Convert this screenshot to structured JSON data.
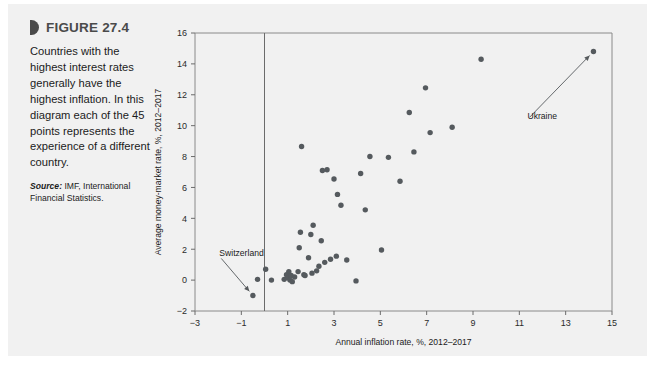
{
  "figure": {
    "marker_icon": "triangle-marker-icon",
    "label": "FIGURE 27.4",
    "caption": "Countries with the highest interest rates generally have the highest inflation. In this diagram each of the 45 points represents the experience of a different country.",
    "source_label": "Source:",
    "source_text": " IMF, International Financial Statistics."
  },
  "colors": {
    "card_background": "#f1f1f1",
    "point": "#555a5e",
    "axis": "#6b6b6b",
    "frame": "#8a8a8a",
    "title_text": "#4a4a4a",
    "body_text": "#1b1b1b"
  },
  "chart_data": {
    "type": "scatter",
    "title": "",
    "xlabel": "Annual inflation rate, %, 2012–2017",
    "ylabel": "Average money-market rate, %, 2012–2017",
    "xlim": [
      -3,
      15
    ],
    "ylim": [
      -2,
      16
    ],
    "xticks": [
      -3,
      -1,
      1,
      3,
      5,
      7,
      9,
      11,
      13,
      15
    ],
    "xticklabels": [
      "−3",
      "−1",
      "1",
      "3",
      "5",
      "7",
      "9",
      "11",
      "13",
      "15"
    ],
    "yticks": [
      -2,
      0,
      2,
      4,
      6,
      8,
      10,
      12,
      14,
      16
    ],
    "yticklabels": [
      "−2",
      "0",
      "2",
      "4",
      "6",
      "8",
      "10",
      "12",
      "14",
      "16"
    ],
    "grid": false,
    "legend": null,
    "n_points": 45,
    "reference_lines": [
      {
        "name": "zero-inflation-line",
        "orientation": "vertical",
        "x": 0
      }
    ],
    "annotations": [
      {
        "name": "switzerland-annotation",
        "label": "Switzerland",
        "text_x": -1.95,
        "text_y": 1.55,
        "point_x": -0.5,
        "point_y": -1.0
      },
      {
        "name": "ukraine-annotation",
        "label": "Ukraine",
        "text_x": 11.35,
        "text_y": 10.4,
        "point_x": 14.2,
        "point_y": 14.8
      }
    ],
    "points": [
      [
        -0.5,
        -1.0
      ],
      [
        -0.3,
        0.05
      ],
      [
        0.05,
        0.7
      ],
      [
        0.3,
        0.0
      ],
      [
        0.85,
        0.05
      ],
      [
        0.95,
        0.35
      ],
      [
        1.0,
        0.15
      ],
      [
        1.05,
        0.55
      ],
      [
        1.1,
        0.0
      ],
      [
        1.15,
        0.3
      ],
      [
        1.2,
        -0.1
      ],
      [
        1.3,
        0.2
      ],
      [
        1.45,
        0.55
      ],
      [
        1.5,
        2.1
      ],
      [
        1.55,
        3.1
      ],
      [
        1.6,
        8.65
      ],
      [
        1.7,
        0.35
      ],
      [
        1.75,
        0.3
      ],
      [
        1.9,
        1.45
      ],
      [
        2.0,
        2.95
      ],
      [
        2.05,
        0.45
      ],
      [
        2.1,
        3.55
      ],
      [
        2.25,
        0.6
      ],
      [
        2.35,
        0.9
      ],
      [
        2.45,
        2.55
      ],
      [
        2.5,
        7.1
      ],
      [
        2.6,
        1.15
      ],
      [
        2.7,
        7.15
      ],
      [
        2.85,
        1.35
      ],
      [
        3.0,
        6.55
      ],
      [
        3.1,
        1.55
      ],
      [
        3.15,
        5.55
      ],
      [
        3.3,
        4.85
      ],
      [
        3.55,
        1.3
      ],
      [
        3.95,
        -0.05
      ],
      [
        4.15,
        6.9
      ],
      [
        4.35,
        4.55
      ],
      [
        4.55,
        8.0
      ],
      [
        5.05,
        1.95
      ],
      [
        5.35,
        7.95
      ],
      [
        5.85,
        6.4
      ],
      [
        6.25,
        10.85
      ],
      [
        6.45,
        8.3
      ],
      [
        6.95,
        12.45
      ],
      [
        7.15,
        9.55
      ],
      [
        8.1,
        9.9
      ],
      [
        9.35,
        14.3
      ],
      [
        14.2,
        14.8
      ]
    ]
  }
}
